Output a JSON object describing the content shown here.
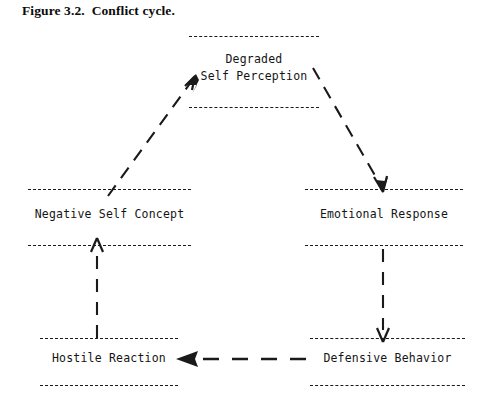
{
  "figure": {
    "caption": "Figure 3.2.  Conflict cycle.",
    "title_number": "Figure 3.2.",
    "title_text": "Conflict cycle."
  },
  "diagram": {
    "type": "cycle-diagram",
    "style": {
      "line_style": "dashed",
      "line_color": "#1a1a1a",
      "background": "#ffffff",
      "text_color": "#141414",
      "node_style": "horizontal-rules-above-and-below"
    },
    "nodes": [
      {
        "id": "degraded-self-perception",
        "label_line1": "Degraded",
        "label_line2": "Self Perception",
        "position": "top-center"
      },
      {
        "id": "negative-self-concept",
        "label_line1": "Negative Self Concept",
        "label_line2": "",
        "position": "middle-left"
      },
      {
        "id": "emotional-response",
        "label_line1": "Emotional Response",
        "label_line2": "",
        "position": "middle-right"
      },
      {
        "id": "hostile-reaction",
        "label_line1": "Hostile Reaction",
        "label_line2": "",
        "position": "bottom-left"
      },
      {
        "id": "defensive-behavior",
        "label_line1": "Defensive Behavior",
        "label_line2": "",
        "position": "bottom-right"
      }
    ],
    "edges": [
      {
        "id": "edge-negative-to-degraded",
        "from": "negative-self-concept",
        "to": "degraded-self-perception",
        "direction": "up-right",
        "arrow": "end"
      },
      {
        "id": "edge-degraded-to-emotional",
        "from": "degraded-self-perception",
        "to": "emotional-response",
        "direction": "down-right",
        "arrow": "end"
      },
      {
        "id": "edge-emotional-to-defensive",
        "from": "emotional-response",
        "to": "defensive-behavior",
        "direction": "down",
        "arrow": "end"
      },
      {
        "id": "edge-defensive-to-hostile",
        "from": "defensive-behavior",
        "to": "hostile-reaction",
        "direction": "left",
        "arrow": "end"
      },
      {
        "id": "edge-hostile-to-negative",
        "from": "hostile-reaction",
        "to": "negative-self-concept",
        "direction": "up",
        "arrow": "end"
      }
    ]
  }
}
